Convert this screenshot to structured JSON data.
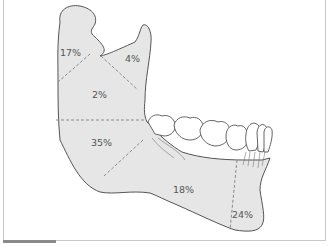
{
  "diagram": {
    "colors": {
      "bone_fill": "#e6e6e6",
      "outline": "#555555",
      "dashed": "#8a8a8a",
      "teeth_fill": "#ffffff",
      "label": "#555555"
    },
    "regions": [
      {
        "name": "condyle",
        "label": "17%"
      },
      {
        "name": "coronoid",
        "label": "4%"
      },
      {
        "name": "ramus",
        "label": "2%"
      },
      {
        "name": "angle",
        "label": "35%"
      },
      {
        "name": "body",
        "label": "18%"
      },
      {
        "name": "symphysis",
        "label": "24%"
      }
    ]
  }
}
